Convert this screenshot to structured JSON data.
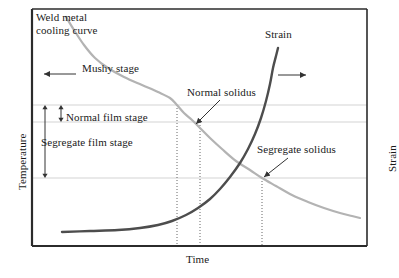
{
  "figure": {
    "type": "line-diagram",
    "background_color": "#ffffff",
    "frame": {
      "color": "#2b2b2b",
      "x0": 32,
      "y0": 9,
      "x1": 367,
      "y1": 246
    }
  },
  "axes": {
    "x_label": "Time",
    "y_left_label": "Temperature",
    "y_right_label": "Strain",
    "ticks_shown": false,
    "tick_labels": []
  },
  "annotations": {
    "weld_metal_cooling_curve": "Weld metal\ncooling curve",
    "mushy_stage": "Mushy stage",
    "normal_solidus": "Normal solidus",
    "strain": "Strain",
    "normal_film_stage": "Normal film stage",
    "segregate_film_stage": "Segregate film stage",
    "segregate_solidus": "Segregate solidus"
  },
  "colors": {
    "cooling_curve": "#b3b3b3",
    "strain_curve": "#4d4d4d",
    "frame": "#2b2b2b",
    "gridline": "#c8c8c8",
    "dotted_line": "#555555",
    "arrow": "#333333",
    "text": "#1a1a1a"
  },
  "chart_data": {
    "type": "line",
    "title": "",
    "xlabel": "Time",
    "ylabel": "Temperature",
    "y2label": "Strain",
    "grid": true,
    "legend": "none",
    "xlim": [
      0,
      1
    ],
    "ylim": [
      0,
      1
    ],
    "gridlines_y_px": [
      105,
      122,
      178
    ],
    "dotted_verticals_x_px": [
      177,
      200,
      262
    ],
    "series": [
      {
        "name": "Weld metal cooling curve",
        "color": "#b3b3b3",
        "axis": "left",
        "points_px": [
          [
            66,
            17
          ],
          [
            74,
            30
          ],
          [
            84,
            45
          ],
          [
            95,
            58
          ],
          [
            108,
            68
          ],
          [
            124,
            77
          ],
          [
            142,
            85
          ],
          [
            158,
            92
          ],
          [
            170,
            98
          ],
          [
            177,
            105
          ],
          [
            184,
            113
          ],
          [
            192,
            120
          ],
          [
            200,
            128
          ],
          [
            210,
            138
          ],
          [
            222,
            149
          ],
          [
            236,
            161
          ],
          [
            250,
            170
          ],
          [
            262,
            178
          ],
          [
            276,
            186
          ],
          [
            292,
            195
          ],
          [
            308,
            202
          ],
          [
            324,
            208
          ],
          [
            340,
            213
          ],
          [
            352,
            216
          ],
          [
            360,
            218
          ]
        ]
      },
      {
        "name": "Strain",
        "color": "#4d4d4d",
        "axis": "right",
        "points_px": [
          [
            62,
            232
          ],
          [
            90,
            231
          ],
          [
            118,
            230
          ],
          [
            140,
            228
          ],
          [
            158,
            225
          ],
          [
            172,
            221
          ],
          [
            186,
            215
          ],
          [
            198,
            208
          ],
          [
            210,
            199
          ],
          [
            220,
            189
          ],
          [
            230,
            177
          ],
          [
            240,
            163
          ],
          [
            248,
            149
          ],
          [
            255,
            134
          ],
          [
            261,
            118
          ],
          [
            266,
            101
          ],
          [
            270,
            84
          ],
          [
            273,
            68
          ],
          [
            276,
            56
          ],
          [
            278,
            48
          ]
        ]
      }
    ],
    "arrows": [
      {
        "name": "mushy-stage-arrow",
        "from_px": [
          76,
          74
        ],
        "to_px": [
          44,
          74
        ],
        "direction": "left"
      },
      {
        "name": "strain-direction-arrow",
        "from_px": [
          278,
          75
        ],
        "to_px": [
          306,
          75
        ],
        "direction": "right"
      },
      {
        "name": "normal-solidus-pointer",
        "from_px": [
          220,
          100
        ],
        "to_px": [
          196,
          124
        ],
        "direction": "down-left"
      },
      {
        "name": "segregate-solidus-pointer",
        "from_px": [
          288,
          158
        ],
        "to_px": [
          264,
          177
        ],
        "direction": "down-left"
      },
      {
        "name": "normal-film-stage-span",
        "from_px": [
          61,
          105
        ],
        "to_px": [
          61,
          122
        ],
        "direction": "double-vertical"
      },
      {
        "name": "segregate-film-stage-span",
        "from_px": [
          45,
          105
        ],
        "to_px": [
          45,
          178
        ],
        "direction": "double-vertical"
      }
    ]
  }
}
